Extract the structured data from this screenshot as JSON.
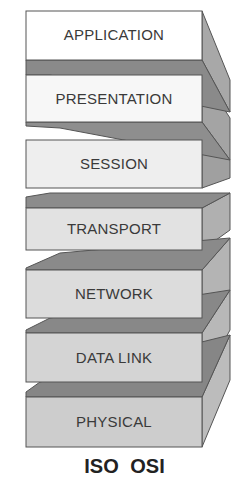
{
  "diagram": {
    "title": "ISO OSI",
    "layers": [
      {
        "label": "APPLICATION",
        "face": "#ffffff",
        "top": 11,
        "bottom": 60,
        "slab": "below",
        "slabTo": 75
      },
      {
        "label": "PRESENTATION",
        "face": "#f7f7f7",
        "top": 75,
        "bottom": 122,
        "slab": "below",
        "slabTo": 128
      },
      {
        "label": "SESSION",
        "face": "#eeeeee",
        "top": 140,
        "bottom": 188,
        "slab": "none"
      },
      {
        "label": "TRANSPORT",
        "face": "#e2e2e2",
        "top": 208,
        "bottom": 250,
        "slab": "above",
        "slabFrom": 193
      },
      {
        "label": "NETWORK",
        "face": "#dcdcdc",
        "top": 270,
        "bottom": 318,
        "slab": "above",
        "slabFrom": 253
      },
      {
        "label": "DATA LINK",
        "face": "#d4d4d4",
        "top": 333,
        "bottom": 382,
        "slab": "above",
        "slabFrom": 318
      },
      {
        "label": "PHYSICAL",
        "face": "#cdcdcd",
        "top": 397,
        "bottom": 447,
        "slab": "above",
        "slabFrom": 382
      }
    ],
    "colors": {
      "stroke": "#555555",
      "side": "#9a9a9a",
      "slab": "#8a8a8a",
      "text": "#3a3a3a"
    }
  }
}
